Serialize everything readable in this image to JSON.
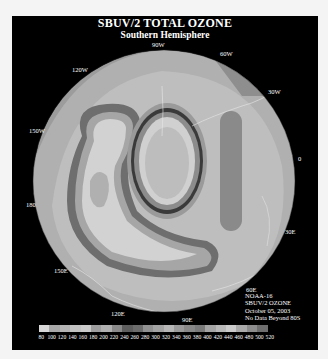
{
  "header": {
    "title": "SBUV/2 TOTAL OZONE",
    "subtitle": "Southern Hemisphere"
  },
  "map": {
    "projection": "south-polar-stereographic",
    "longitude_labels": [
      "90W",
      "60W",
      "30W",
      "0",
      "30E",
      "60E",
      "90E",
      "120E",
      "150E",
      "180",
      "150W",
      "120W"
    ]
  },
  "info": {
    "satellite": "NOAA-16",
    "product": "SBUV/2 OZONE",
    "date": "October 05, 2003",
    "note": "No Data Beyond 80S"
  },
  "colorbar": {
    "unit_hint": "Dobson Units",
    "ticks": [
      "80",
      "100",
      "120",
      "140",
      "160",
      "180",
      "200",
      "220",
      "240",
      "260",
      "280",
      "300",
      "320",
      "340",
      "360",
      "380",
      "400",
      "420",
      "440",
      "460",
      "480",
      "500",
      "520"
    ],
    "colors": [
      "#d8d8d8",
      "#a8a8a8",
      "#b4b4b4",
      "#c2c2c2",
      "#cacaca",
      "#9e9e9e",
      "#b0b0b0",
      "#8a8a8a",
      "#5e5e5e",
      "#6c6c6c",
      "#909090",
      "#a2a2a2",
      "#b6b6b6",
      "#9a9a9a",
      "#888888",
      "#7a7a7a",
      "#a4a4a4",
      "#b8b8b8",
      "#cbcbcb",
      "#aaaaaa",
      "#8c8c8c",
      "#6e6e6e"
    ]
  }
}
